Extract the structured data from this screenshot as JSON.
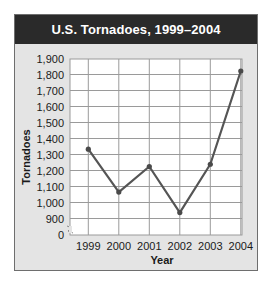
{
  "header": {
    "title": "U.S. Tornadoes, 1999–2004"
  },
  "colors": {
    "header_bg": "#2a2a2a",
    "header_text": "#ffffff",
    "panel_bg": "#e4e4e4",
    "plot_bg": "#ffffff",
    "grid": "#9a9a9a",
    "line": "#555555",
    "marker": "#4a4a4a"
  },
  "chart_data": {
    "type": "line",
    "title": "U.S. Tornadoes, 1999–2004",
    "xlabel": "Year",
    "ylabel": "Tornadoes",
    "categories": [
      "1999",
      "2000",
      "2001",
      "2002",
      "2003",
      "2004"
    ],
    "series": [
      {
        "name": "Tornadoes",
        "values": [
          1333,
          1065,
          1225,
          937,
          1239,
          1822
        ]
      }
    ],
    "y_ticks": [
      "0",
      "900",
      "1,000",
      "1,100",
      "1,200",
      "1,300",
      "1,400",
      "1,500",
      "1,600",
      "1,700",
      "1,800",
      "1,900"
    ],
    "y_tick_values": [
      0,
      900,
      1000,
      1100,
      1200,
      1300,
      1400,
      1500,
      1600,
      1700,
      1800,
      1900
    ],
    "ylim": [
      0,
      1900
    ],
    "axis_break": "between 0 and 900",
    "grid": true,
    "legend": "none"
  }
}
